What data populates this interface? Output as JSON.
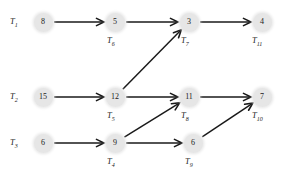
{
  "diagram": {
    "type": "task-dependency-graph",
    "title": "",
    "node_fill": "#e6e6e6",
    "edge_color": "#1a1a1a",
    "rows": [
      {
        "start_label": "T",
        "start_sub": "1"
      },
      {
        "start_label": "T",
        "start_sub": "2"
      },
      {
        "start_label": "T",
        "start_sub": "3"
      }
    ],
    "row_labels": [
      {
        "id": "row-label-t1",
        "text": "T",
        "sub": "1",
        "x": 10,
        "y": 17
      },
      {
        "id": "row-label-t2",
        "text": "T",
        "sub": "2",
        "x": 10,
        "y": 92
      },
      {
        "id": "row-label-t3",
        "text": "T",
        "sub": "3",
        "x": 10,
        "y": 138
      }
    ],
    "nodes": [
      {
        "id": "node-t1",
        "value": "8",
        "task": "T",
        "sub": "1",
        "cx": 43,
        "cy": 22,
        "show_task_label": false,
        "label_x": 0,
        "label_y": 0
      },
      {
        "id": "node-t6",
        "value": "5",
        "task": "T",
        "sub": "6",
        "cx": 115,
        "cy": 22,
        "show_task_label": true,
        "label_x": 107,
        "label_y": 36
      },
      {
        "id": "node-t7",
        "value": "3",
        "task": "T",
        "sub": "7",
        "cx": 189,
        "cy": 22,
        "show_task_label": true,
        "label_x": 181,
        "label_y": 36
      },
      {
        "id": "node-t11",
        "value": "4",
        "task": "T",
        "sub": "11",
        "cx": 262,
        "cy": 22,
        "show_task_label": true,
        "label_x": 252,
        "label_y": 36
      },
      {
        "id": "node-t2",
        "value": "15",
        "task": "T",
        "sub": "2",
        "cx": 43,
        "cy": 97,
        "show_task_label": false,
        "label_x": 0,
        "label_y": 0
      },
      {
        "id": "node-t5",
        "value": "12",
        "task": "T",
        "sub": "5",
        "cx": 115,
        "cy": 97,
        "show_task_label": true,
        "label_x": 107,
        "label_y": 111
      },
      {
        "id": "node-t8",
        "value": "11",
        "task": "T",
        "sub": "8",
        "cx": 189,
        "cy": 97,
        "show_task_label": true,
        "label_x": 181,
        "label_y": 111
      },
      {
        "id": "node-t10",
        "value": "7",
        "task": "T",
        "sub": "10",
        "cx": 262,
        "cy": 97,
        "show_task_label": true,
        "label_x": 252,
        "label_y": 111
      },
      {
        "id": "node-t3",
        "value": "6",
        "task": "T",
        "sub": "3",
        "cx": 43,
        "cy": 143,
        "show_task_label": false,
        "label_x": 0,
        "label_y": 0
      },
      {
        "id": "node-t4",
        "value": "9",
        "task": "T",
        "sub": "4",
        "cx": 115,
        "cy": 143,
        "show_task_label": true,
        "label_x": 107,
        "label_y": 157
      },
      {
        "id": "node-t9",
        "value": "6",
        "task": "T",
        "sub": "9",
        "cx": 193,
        "cy": 143,
        "show_task_label": true,
        "label_x": 185,
        "label_y": 157
      }
    ],
    "edges": [
      {
        "id": "edge-t1-t6",
        "from": "node-t1",
        "to": "node-t6"
      },
      {
        "id": "edge-t6-t7",
        "from": "node-t6",
        "to": "node-t7"
      },
      {
        "id": "edge-t7-t11",
        "from": "node-t7",
        "to": "node-t11"
      },
      {
        "id": "edge-t2-t5",
        "from": "node-t2",
        "to": "node-t5"
      },
      {
        "id": "edge-t5-t7",
        "from": "node-t5",
        "to": "node-t7"
      },
      {
        "id": "edge-t5-t8",
        "from": "node-t5",
        "to": "node-t8"
      },
      {
        "id": "edge-t3-t4",
        "from": "node-t3",
        "to": "node-t4"
      },
      {
        "id": "edge-t4-t8",
        "from": "node-t4",
        "to": "node-t8"
      },
      {
        "id": "edge-t4-t9",
        "from": "node-t4",
        "to": "node-t9"
      },
      {
        "id": "edge-t8-t10",
        "from": "node-t8",
        "to": "node-t10"
      },
      {
        "id": "edge-t9-t10",
        "from": "node-t9",
        "to": "node-t10"
      }
    ]
  }
}
